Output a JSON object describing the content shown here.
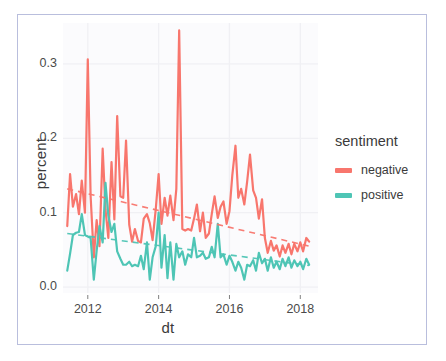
{
  "chart_data": {
    "type": "line",
    "title": "",
    "xlabel": "dt",
    "ylabel": "percent",
    "xlim": [
      2011.3,
      2018.5
    ],
    "ylim": [
      -0.008,
      0.355
    ],
    "xticks": [
      2012,
      2014,
      2016,
      2018
    ],
    "xticklabels": [
      "2012",
      "2014",
      "2016",
      "2018"
    ],
    "yticks": [
      0.0,
      0.1,
      0.2,
      0.3
    ],
    "yticklabels": [
      "0.0",
      "0.1",
      "0.2",
      "0.3"
    ],
    "grid": true,
    "legend": {
      "title": "sentiment",
      "position": "right",
      "entries": [
        {
          "label": "negative",
          "color": "#f8766d"
        },
        {
          "label": "positive",
          "color": "#4ec5b5"
        }
      ]
    },
    "annotations": [
      {
        "kind": "trend-line",
        "series": "negative",
        "style": "dashed",
        "color": "#f8766d"
      },
      {
        "kind": "trend-line",
        "series": "positive",
        "style": "dashed",
        "color": "#4ec5b5"
      }
    ],
    "series": [
      {
        "name": "negative",
        "color": "#f8766d",
        "x": [
          2011.42,
          2011.5,
          2011.58,
          2011.67,
          2011.75,
          2011.83,
          2011.92,
          2012.0,
          2012.08,
          2012.17,
          2012.25,
          2012.33,
          2012.42,
          2012.5,
          2012.58,
          2012.67,
          2012.75,
          2012.83,
          2012.92,
          2013.0,
          2013.08,
          2013.17,
          2013.25,
          2013.33,
          2013.42,
          2013.5,
          2013.58,
          2013.67,
          2013.75,
          2013.83,
          2013.92,
          2014.0,
          2014.08,
          2014.17,
          2014.25,
          2014.33,
          2014.42,
          2014.5,
          2014.58,
          2014.67,
          2014.75,
          2014.83,
          2014.92,
          2015.0,
          2015.08,
          2015.17,
          2015.25,
          2015.33,
          2015.42,
          2015.5,
          2015.58,
          2015.67,
          2015.75,
          2015.83,
          2015.92,
          2016.0,
          2016.08,
          2016.17,
          2016.25,
          2016.33,
          2016.42,
          2016.5,
          2016.58,
          2016.67,
          2016.75,
          2016.83,
          2016.92,
          2017.0,
          2017.08,
          2017.17,
          2017.25,
          2017.33,
          2017.42,
          2017.5,
          2017.58,
          2017.67,
          2017.75,
          2017.83,
          2017.92,
          2018.0,
          2018.08,
          2018.17,
          2018.25
        ],
        "y": [
          0.082,
          0.152,
          0.108,
          0.125,
          0.098,
          0.143,
          0.1,
          0.306,
          0.122,
          0.04,
          0.09,
          0.055,
          0.186,
          0.104,
          0.066,
          0.168,
          0.091,
          0.23,
          0.122,
          0.12,
          0.197,
          0.084,
          0.061,
          0.078,
          0.062,
          0.06,
          0.092,
          0.098,
          0.086,
          0.063,
          0.105,
          0.152,
          0.085,
          0.12,
          0.096,
          0.123,
          0.09,
          0.132,
          0.345,
          0.078,
          0.076,
          0.078,
          0.076,
          0.092,
          0.111,
          0.075,
          0.1,
          0.066,
          0.072,
          0.098,
          0.122,
          0.093,
          0.108,
          0.115,
          0.085,
          0.102,
          0.15,
          0.19,
          0.12,
          0.132,
          0.111,
          0.142,
          0.178,
          0.13,
          0.12,
          0.092,
          0.118,
          0.066,
          0.046,
          0.062,
          0.049,
          0.056,
          0.041,
          0.056,
          0.046,
          0.058,
          0.044,
          0.058,
          0.048,
          0.06,
          0.048,
          0.066,
          0.061
        ]
      },
      {
        "name": "positive",
        "color": "#4ec5b5",
        "x": [
          2011.42,
          2011.5,
          2011.58,
          2011.67,
          2011.75,
          2011.83,
          2011.92,
          2012.0,
          2012.08,
          2012.17,
          2012.25,
          2012.33,
          2012.42,
          2012.5,
          2012.58,
          2012.67,
          2012.75,
          2012.83,
          2012.92,
          2013.0,
          2013.08,
          2013.17,
          2013.25,
          2013.33,
          2013.42,
          2013.5,
          2013.58,
          2013.67,
          2013.75,
          2013.83,
          2013.92,
          2014.0,
          2014.08,
          2014.17,
          2014.25,
          2014.33,
          2014.42,
          2014.5,
          2014.58,
          2014.67,
          2014.75,
          2014.83,
          2014.92,
          2015.0,
          2015.08,
          2015.17,
          2015.25,
          2015.33,
          2015.42,
          2015.5,
          2015.58,
          2015.67,
          2015.75,
          2015.83,
          2015.92,
          2016.0,
          2016.08,
          2016.17,
          2016.25,
          2016.33,
          2016.42,
          2016.5,
          2016.58,
          2016.67,
          2016.75,
          2016.83,
          2016.92,
          2017.0,
          2017.08,
          2017.17,
          2017.25,
          2017.33,
          2017.42,
          2017.5,
          2017.58,
          2017.67,
          2017.75,
          2017.83,
          2017.92,
          2018.0,
          2018.08,
          2018.17,
          2018.25
        ],
        "y": [
          0.022,
          0.045,
          0.07,
          0.073,
          0.074,
          0.098,
          0.07,
          0.068,
          0.066,
          0.01,
          0.049,
          0.082,
          0.06,
          0.14,
          0.096,
          0.074,
          0.085,
          0.048,
          0.038,
          0.03,
          0.03,
          0.034,
          0.028,
          0.03,
          0.028,
          0.042,
          0.024,
          0.06,
          0.01,
          0.04,
          0.055,
          0.1,
          0.026,
          0.07,
          0.012,
          0.06,
          0.01,
          0.058,
          0.04,
          0.048,
          0.03,
          0.044,
          0.04,
          0.066,
          0.04,
          0.042,
          0.046,
          0.038,
          0.04,
          0.054,
          0.04,
          0.085,
          0.04,
          0.044,
          0.03,
          0.042,
          0.034,
          0.022,
          0.034,
          0.026,
          0.01,
          0.03,
          0.028,
          0.036,
          0.022,
          0.046,
          0.032,
          0.038,
          0.022,
          0.04,
          0.026,
          0.034,
          0.024,
          0.038,
          0.028,
          0.04,
          0.026,
          0.036,
          0.028,
          0.034,
          0.024,
          0.038,
          0.03
        ]
      }
    ],
    "trend_lines": [
      {
        "name": "negative",
        "color": "#f8766d",
        "x0": 2011.42,
        "y0": 0.132,
        "x1": 2018.25,
        "y1": 0.055
      },
      {
        "name": "positive",
        "color": "#4ec5b5",
        "x0": 2011.42,
        "y0": 0.072,
        "x1": 2018.25,
        "y1": 0.029
      }
    ],
    "panel": {
      "background": "#fbfbfd",
      "gridline_color": "#f0f0f4"
    }
  }
}
